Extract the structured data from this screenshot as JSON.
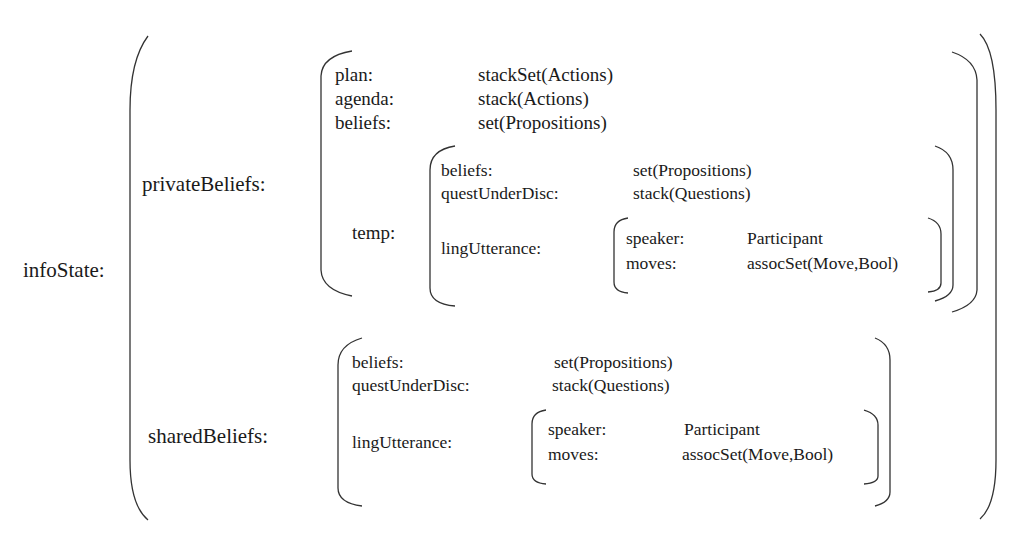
{
  "root": {
    "label": "infoState:",
    "privateBeliefs": {
      "label": "privateBeliefs:",
      "fields": [
        {
          "key": "plan:",
          "value": "stackSet(Actions)"
        },
        {
          "key": "agenda:",
          "value": "stack(Actions)"
        },
        {
          "key": "beliefs:",
          "value": "set(Propositions)"
        }
      ],
      "temp": {
        "label": "temp:",
        "fields": [
          {
            "key": "beliefs:",
            "value": "set(Propositions)"
          },
          {
            "key": "questUnderDisc:",
            "value": "stack(Questions)"
          }
        ],
        "lingUtterance": {
          "label": "lingUtterance:",
          "fields": [
            {
              "key": "speaker:",
              "value": "Participant"
            },
            {
              "key": "moves:",
              "value": "assocSet(Move,Bool)"
            }
          ]
        }
      }
    },
    "sharedBeliefs": {
      "label": "sharedBeliefs:",
      "fields": [
        {
          "key": "beliefs:",
          "value": "set(Propositions)"
        },
        {
          "key": "questUnderDisc:",
          "value": "stack(Questions)"
        }
      ],
      "lingUtterance": {
        "label": "lingUtterance:",
        "fields": [
          {
            "key": "speaker:",
            "value": "Participant"
          },
          {
            "key": "moves:",
            "value": "assocSet(Move,Bool)"
          }
        ]
      }
    }
  },
  "colors": {
    "ink": "#1a1a1a",
    "bracket": "#333333",
    "background": "#ffffff"
  }
}
